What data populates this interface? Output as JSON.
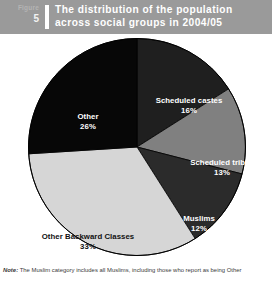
{
  "header": {
    "figure_label": "Figure",
    "figure_number": "5",
    "title_line1": "The distribution of the population",
    "title_line2": "across social groups in 2004/05",
    "bar_color": "#9a9a9a",
    "title_color": "#ffffff"
  },
  "footnote": {
    "note_word": "Note:",
    "text": " The Muslim category includes all Muslims, including those who report as being Other"
  },
  "chart_data": {
    "type": "pie",
    "title": "The distribution of the population across social groups in 2004/05",
    "xlabel": "",
    "ylabel": "",
    "unit": "%",
    "legend_position": "none",
    "grid": false,
    "start_angle_deg": 0,
    "direction": "clockwise",
    "categories": [
      "Scheduled castes",
      "Scheduled tribes",
      "Muslims",
      "Other Backward Classes",
      "Other"
    ],
    "values": [
      16,
      13,
      12,
      33,
      26
    ],
    "labels": [
      "Scheduled castes",
      "Scheduled tribes",
      "Muslims",
      "Other Backward Classes",
      "Other"
    ],
    "value_labels": [
      "16%",
      "13%",
      "12%",
      "33%",
      "26%"
    ],
    "colors": [
      "#1f1f1f",
      "#808080",
      "#2b2b2b",
      "#d6d6d6",
      "#070707"
    ],
    "label_text_colors": [
      "#ffffff",
      "#ffffff",
      "#ffffff",
      "#111111",
      "#ffffff"
    ],
    "slices": [
      {
        "name": "Scheduled castes",
        "value": 16,
        "value_label": "16%",
        "color": "#1f1f1f"
      },
      {
        "name": "Scheduled tribes",
        "value": 13,
        "value_label": "13%",
        "color": "#808080"
      },
      {
        "name": "Muslims",
        "value": 12,
        "value_label": "12%",
        "color": "#2b2b2b"
      },
      {
        "name": "Other Backward Classes",
        "value": 33,
        "value_label": "33%",
        "color": "#d6d6d6"
      },
      {
        "name": "Other",
        "value": 26,
        "value_label": "26%",
        "color": "#070707"
      }
    ]
  }
}
